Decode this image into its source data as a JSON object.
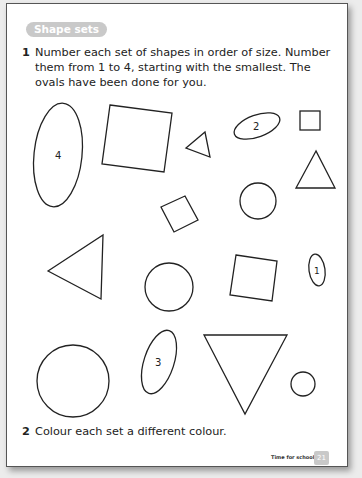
{
  "heading": "Shape sets",
  "questions": [
    {
      "number": "1",
      "text": "Number each set of shapes in order of size. Number them from 1 to 4, starting with the smallest. The ovals have been done for you."
    },
    {
      "number": "2",
      "text": "Colour each set a different colour."
    }
  ],
  "oval_labels": {
    "large": "4",
    "medium_flat": "2",
    "medium_tall": "3",
    "small": "1"
  },
  "footer": {
    "title": "Time for school",
    "page_number": "21"
  }
}
